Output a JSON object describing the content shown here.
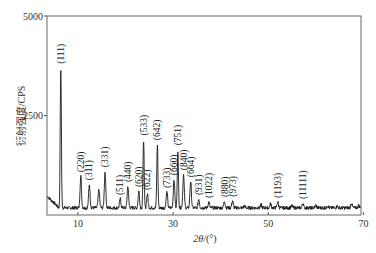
{
  "chart_data": {
    "type": "line",
    "title": "",
    "xlabel": "2θ/(°)",
    "ylabel": "衍射强度/CPS",
    "xlim": [
      3.5,
      69.5
    ],
    "ylim": [
      0,
      5000
    ],
    "xticks": [
      10,
      30,
      50,
      70
    ],
    "yticks": [
      2500,
      5000
    ],
    "grid": false,
    "legend": null,
    "baseline": 180,
    "series": [
      {
        "name": "XRD pattern",
        "color": "#1a1a1a",
        "peaks": [
          {
            "x": 6.4,
            "y": 3700,
            "label": "(111)"
          },
          {
            "x": 10.6,
            "y": 975,
            "label": "(220)"
          },
          {
            "x": 12.4,
            "y": 775,
            "label": "(311)"
          },
          {
            "x": 14.4,
            "y": 650,
            "label": ""
          },
          {
            "x": 15.7,
            "y": 1100,
            "label": "(331)"
          },
          {
            "x": 18.9,
            "y": 400,
            "label": "(511)"
          },
          {
            "x": 20.5,
            "y": 725,
            "label": "(440)"
          },
          {
            "x": 22.8,
            "y": 600,
            "label": "(620)"
          },
          {
            "x": 23.8,
            "y": 1900,
            "label": "(533)"
          },
          {
            "x": 24.6,
            "y": 525,
            "label": "(622)"
          },
          {
            "x": 26.7,
            "y": 1780,
            "label": "(642)"
          },
          {
            "x": 28.7,
            "y": 575,
            "label": "(733)"
          },
          {
            "x": 30.2,
            "y": 900,
            "label": "(660)"
          },
          {
            "x": 31.0,
            "y": 1650,
            "label": "(751)"
          },
          {
            "x": 32.2,
            "y": 1025,
            "label": "(840)"
          },
          {
            "x": 33.7,
            "y": 850,
            "label": "(664)"
          },
          {
            "x": 35.4,
            "y": 400,
            "label": "(931)"
          },
          {
            "x": 37.5,
            "y": 325,
            "label": "(1022)"
          },
          {
            "x": 40.8,
            "y": 350,
            "label": "(880)"
          },
          {
            "x": 42.5,
            "y": 360,
            "label": "(973)"
          },
          {
            "x": 45.0,
            "y": 230,
            "label": ""
          },
          {
            "x": 48.5,
            "y": 250,
            "label": ""
          },
          {
            "x": 50.5,
            "y": 280,
            "label": ""
          },
          {
            "x": 52.0,
            "y": 330,
            "label": "(1193)"
          },
          {
            "x": 55.0,
            "y": 230,
            "label": ""
          },
          {
            "x": 57.3,
            "y": 300,
            "label": "(11111)"
          },
          {
            "x": 60.0,
            "y": 240,
            "label": ""
          },
          {
            "x": 62.5,
            "y": 230,
            "label": ""
          },
          {
            "x": 64.5,
            "y": 220,
            "label": ""
          },
          {
            "x": 67.5,
            "y": 300,
            "label": ""
          },
          {
            "x": 69.0,
            "y": 240,
            "label": ""
          }
        ],
        "start": [
          {
            "x": 3.6,
            "y": 650
          },
          {
            "x": 4.5,
            "y": 480
          },
          {
            "x": 5.5,
            "y": 420
          }
        ]
      }
    ]
  },
  "axes": {
    "y_tick_labels": [
      "2500",
      "5000"
    ],
    "x_tick_labels": [
      "10",
      "30",
      "50",
      "70"
    ]
  },
  "labels": {
    "ylabel": "衍射强度/CPS",
    "xlabel_var": "2θ",
    "xlabel_unit": "/(°)"
  }
}
